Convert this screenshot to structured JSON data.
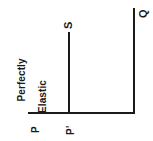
{
  "figure": {
    "orientation": "rotated-90-ccw",
    "background_color": "#ffffff",
    "stroke_color": "#1a1a1a"
  },
  "axis_title": {
    "line1": "Perfectly",
    "line2": "Elastic"
  },
  "labels": {
    "supply": "S",
    "quantity": "Q",
    "price": "P",
    "price_prime": "P’"
  },
  "chart_data": {
    "type": "line",
    "title": "Perfectly Elastic",
    "xlabel": "",
    "ylabel": "Perfectly Elastic",
    "grid": false,
    "legend": "none",
    "annotations": [
      {
        "text": "Perfectly Elastic",
        "role": "axis-title"
      },
      {
        "text": "S",
        "role": "supply-curve-label"
      },
      {
        "text": "Q",
        "role": "quantity-axis-label"
      },
      {
        "text": "P",
        "role": "price-tick"
      },
      {
        "text": "P’",
        "role": "price-tick"
      }
    ],
    "series": [
      {
        "name": "S",
        "note": "Perfectly elastic supply drawn as a straight line at a single price level",
        "x": [
          0,
          0
        ],
        "y": [
          0,
          1
        ]
      },
      {
        "name": "Q",
        "note": "Quantity axis boundary line",
        "x": [
          1,
          1
        ],
        "y": [
          0,
          1
        ]
      }
    ],
    "categories": [
      "P",
      "P’"
    ],
    "values": [
      0,
      1
    ],
    "xlim": [
      0,
      1
    ],
    "ylim": [
      0,
      1
    ]
  }
}
